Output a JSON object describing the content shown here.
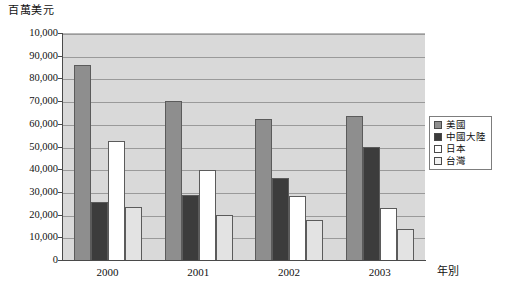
{
  "chart_data": {
    "type": "bar",
    "title": "",
    "ylabel": "百萬美元",
    "xlabel": "年別",
    "categories": [
      "2000",
      "2001",
      "2002",
      "2003"
    ],
    "ylim": [
      0,
      100000
    ],
    "ytick_labels": [
      "10,000",
      "90,000",
      "80,000",
      "70,000",
      "60,000",
      "50,000",
      "40,000",
      "30,000",
      "20,000",
      "10,000",
      "0"
    ],
    "ytick_values": [
      100000,
      90000,
      80000,
      70000,
      60000,
      50000,
      40000,
      30000,
      20000,
      10000,
      0
    ],
    "grid": true,
    "legend_position": "right",
    "series": [
      {
        "name": "美國",
        "color": "#8e8e8e",
        "values": [
          86000,
          70000,
          62000,
          63500
        ]
      },
      {
        "name": "中國大陸",
        "color": "#3c3c3c",
        "values": [
          25500,
          28500,
          36000,
          50000
        ]
      },
      {
        "name": "日本",
        "color": "#ffffff",
        "values": [
          52500,
          39500,
          28000,
          23000
        ]
      },
      {
        "name": "台灣",
        "color": "#e3e3e3",
        "values": [
          23500,
          20000,
          17500,
          13500
        ]
      }
    ]
  },
  "colors": {
    "plot_background": "#d9d9d9",
    "gridline": "#9a9a9a",
    "axis": "#4a4a4a",
    "bar_border": "#5b5b5b",
    "legend_border": "#7d7d7d"
  }
}
